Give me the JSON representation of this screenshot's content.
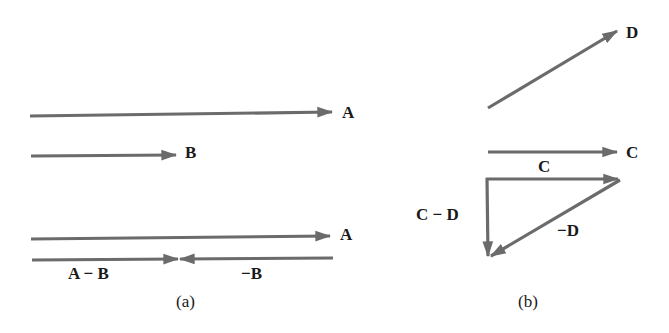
{
  "panel_a": {
    "caption": "(a)",
    "labels": {
      "A_top": "A",
      "B": "B",
      "A_bottom": "A",
      "A_minus_B": "A − B",
      "neg_B": "−B"
    }
  },
  "panel_b": {
    "caption": "(b)",
    "labels": {
      "D": "D",
      "C_right": "C",
      "C_top": "C",
      "C_minus_D": "C − D",
      "neg_D": "−D"
    }
  },
  "colors": {
    "arrow": "#6b6b6b",
    "text": "#1a1a1a",
    "background": "#ffffff"
  }
}
